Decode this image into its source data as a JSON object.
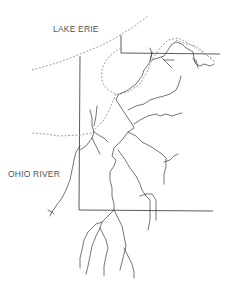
{
  "map": {
    "labels": {
      "lake": "LAKE ERIE",
      "river": "OHIO RIVER"
    },
    "colors": {
      "background": "#ffffff",
      "lines": "#3a3a3a",
      "dashed": "#888888",
      "text": "#555555"
    }
  }
}
